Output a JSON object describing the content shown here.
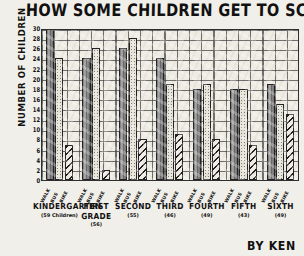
{
  "chart_data": {
    "type": "bar",
    "title": "HOW SOME CHILDREN GET TO SCHOOL",
    "xlabel": "",
    "ylabel": "NUMBER OF CHILDREN",
    "ylim": [
      0,
      30
    ],
    "grid": true,
    "legend_position": "none",
    "signature": "BY KEN",
    "categories": [
      "KINDERGARTEN",
      "FIRST GRADE",
      "SECOND",
      "THIRD",
      "FOURTH",
      "FIFTH",
      "SIXTH"
    ],
    "category_counts": [
      "(59 Children)",
      "(56)",
      "(55)",
      "(46)",
      "(49)",
      "(43)",
      "(49)"
    ],
    "series_names": [
      "WALK",
      "BUS",
      "BIKE"
    ],
    "series": [
      {
        "name": "WALK",
        "values": [
          30,
          24,
          26,
          24,
          18,
          18,
          19
        ]
      },
      {
        "name": "BUS",
        "values": [
          24,
          26,
          28,
          19,
          19,
          18,
          15
        ]
      },
      {
        "name": "BIKE",
        "values": [
          7,
          2,
          8,
          9,
          8,
          7,
          13
        ]
      }
    ],
    "yticks": [
      0,
      2,
      4,
      6,
      8,
      10,
      12,
      14,
      16,
      18,
      20,
      22,
      24,
      26,
      28,
      30
    ],
    "colors": {
      "walk": "#8e8e8e",
      "bus": "#e9e6dc",
      "bike": "#efece4",
      "ink": "#1f1f1f",
      "paper": "#f1efe9"
    }
  }
}
